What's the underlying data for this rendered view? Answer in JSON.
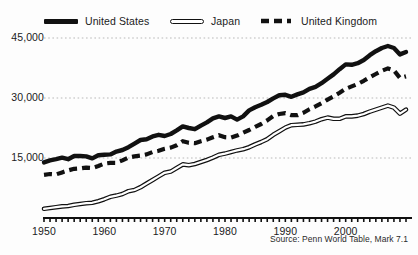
{
  "legend": {
    "items": [
      {
        "label": "United States",
        "style": "solid-thick",
        "icon": "line-solid-icon"
      },
      {
        "label": "Japan",
        "style": "hollow-double",
        "icon": "line-hollow-icon"
      },
      {
        "label": "United Kingdom",
        "style": "dashed",
        "icon": "line-dashed-icon"
      }
    ]
  },
  "source": {
    "text": "Source: Penn World Table, Mark 7.1"
  },
  "chart_data": {
    "type": "line",
    "title": "",
    "subtitle": "",
    "xlabel": "",
    "ylabel": "",
    "xlim": [
      1950,
      2010
    ],
    "ylim": [
      0,
      48000
    ],
    "grid": true,
    "gridlines": [
      15000,
      30000,
      45000
    ],
    "y_ticks": [
      15000,
      30000,
      45000
    ],
    "y_tick_labels": [
      "15,000",
      "30,000",
      "45,000"
    ],
    "x_ticks": [
      1950,
      1960,
      1970,
      1980,
      1990,
      2000
    ],
    "x_tick_labels": [
      "1950",
      "1960",
      "1970",
      "1980",
      "1990",
      "2000"
    ],
    "x_minor_tick_interval": 1,
    "legend_position": "top",
    "colors": {
      "line": "#111111",
      "grid": "#b9b9b9",
      "axis": "#111111",
      "background": "#fdfdfd"
    },
    "x": [
      1950,
      1951,
      1952,
      1953,
      1954,
      1955,
      1956,
      1957,
      1958,
      1959,
      1960,
      1961,
      1962,
      1963,
      1964,
      1965,
      1966,
      1967,
      1968,
      1969,
      1970,
      1971,
      1972,
      1973,
      1974,
      1975,
      1976,
      1977,
      1978,
      1979,
      1980,
      1981,
      1982,
      1983,
      1984,
      1985,
      1986,
      1987,
      1988,
      1989,
      1990,
      1991,
      1992,
      1993,
      1994,
      1995,
      1996,
      1997,
      1998,
      1999,
      2000,
      2001,
      2002,
      2003,
      2004,
      2005,
      2006,
      2007,
      2008,
      2009,
      2010
    ],
    "series": [
      {
        "name": "United States",
        "values": [
          13900,
          14400,
          14700,
          15100,
          14700,
          15500,
          15500,
          15400,
          14900,
          15700,
          15800,
          15900,
          16600,
          17000,
          17700,
          18600,
          19500,
          19700,
          20400,
          20800,
          20500,
          21000,
          21900,
          22900,
          22500,
          22200,
          23100,
          23900,
          24900,
          25400,
          25000,
          25400,
          24600,
          25400,
          26900,
          27700,
          28300,
          29000,
          29900,
          30700,
          30800,
          30300,
          30900,
          31400,
          32300,
          32800,
          33700,
          34800,
          35900,
          37200,
          38400,
          38300,
          38700,
          39500,
          40700,
          41700,
          42500,
          43000,
          42500,
          40900,
          41500
        ]
      },
      {
        "name": "Japan",
        "values": [
          2300,
          2500,
          2700,
          2900,
          3000,
          3300,
          3500,
          3700,
          3800,
          4200,
          4700,
          5300,
          5600,
          6000,
          6700,
          7000,
          7700,
          8600,
          9500,
          10400,
          11300,
          11600,
          12500,
          13400,
          13200,
          13500,
          14000,
          14500,
          15100,
          15800,
          16100,
          16500,
          16900,
          17200,
          17700,
          18400,
          19000,
          19700,
          20800,
          21700,
          22600,
          23200,
          23300,
          23400,
          23700,
          24100,
          24700,
          25100,
          24800,
          24800,
          25400,
          25400,
          25600,
          26000,
          26600,
          27100,
          27600,
          28100,
          27600,
          26100,
          27100
        ]
      },
      {
        "name": "United Kingdom",
        "values": [
          10800,
          11000,
          10900,
          11400,
          11900,
          12300,
          12400,
          12600,
          12500,
          13000,
          13600,
          13800,
          13800,
          14400,
          15100,
          15400,
          15600,
          15900,
          16500,
          16800,
          17300,
          17600,
          18200,
          19200,
          18800,
          18700,
          19200,
          19600,
          20200,
          20700,
          20200,
          20100,
          20600,
          21300,
          22000,
          22800,
          23500,
          24400,
          25500,
          26000,
          26200,
          25700,
          25700,
          26300,
          27200,
          27900,
          28700,
          29600,
          30400,
          31300,
          32300,
          32900,
          33500,
          34300,
          35200,
          36000,
          36800,
          37400,
          36900,
          35000,
          35400
        ]
      }
    ]
  }
}
